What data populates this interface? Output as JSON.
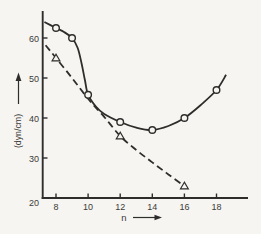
{
  "figure": {
    "background": "#f6f5f2",
    "line_color": "#2e2d2b",
    "text_color": "#3c3b38"
  },
  "chart_data": {
    "type": "line",
    "title": "",
    "xlabel": "n",
    "ylabel": "(dyn/cm)",
    "x_ticks": [
      8,
      10,
      12,
      14,
      16,
      18
    ],
    "y_ticks": [
      20,
      30,
      40,
      50,
      60
    ],
    "xlim": [
      7.17,
      19.95
    ],
    "ylim": [
      20,
      66.8
    ],
    "grid": false,
    "legend": "none",
    "series": [
      {
        "name": "upper-solid-circle-series",
        "line_style": "solid",
        "marker": "circle",
        "marker_points": [
          [
            8,
            62.5
          ],
          [
            9,
            60
          ],
          [
            10,
            45.8
          ],
          [
            12,
            39
          ],
          [
            14,
            37
          ],
          [
            16,
            40
          ],
          [
            18,
            47
          ]
        ],
        "curve_points": [
          [
            7.28,
            64
          ],
          [
            8,
            62.5
          ],
          [
            8.5,
            61.5
          ],
          [
            9,
            60
          ],
          [
            9.35,
            57.5
          ],
          [
            9.6,
            53.5
          ],
          [
            9.8,
            49.5
          ],
          [
            10,
            45.8
          ],
          [
            10.5,
            42.8
          ],
          [
            11,
            41
          ],
          [
            12,
            39
          ],
          [
            13,
            37.6
          ],
          [
            14,
            37
          ],
          [
            15,
            38
          ],
          [
            16,
            40
          ],
          [
            17,
            43.2
          ],
          [
            18,
            47
          ],
          [
            18.6,
            50.8
          ]
        ]
      },
      {
        "name": "lower-dashed-triangle-series",
        "line_style": "dashed",
        "marker": "triangle",
        "marker_points": [
          [
            8,
            55
          ],
          [
            12,
            35.5
          ],
          [
            16,
            23
          ]
        ],
        "curve_points": [
          [
            7.35,
            58.2
          ],
          [
            8,
            55
          ],
          [
            9,
            50
          ],
          [
            10,
            44.8
          ],
          [
            11,
            40.3
          ],
          [
            12,
            35.5
          ],
          [
            13,
            32
          ],
          [
            14,
            28.9
          ],
          [
            15,
            25.9
          ],
          [
            16,
            23
          ]
        ]
      }
    ]
  }
}
